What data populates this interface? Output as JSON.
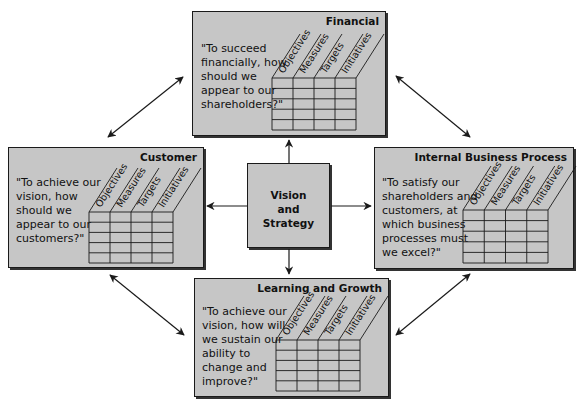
{
  "diagram": {
    "type": "balanced-scorecard",
    "center": {
      "lines": [
        "Vision",
        "and",
        "Strategy"
      ]
    },
    "column_headers": [
      "Objectives",
      "Measures",
      "Targets",
      "Initiatives"
    ],
    "table_rows": 5,
    "perspectives": [
      {
        "id": "financial",
        "title": "Financial",
        "quote_lines": [
          "\"To succeed",
          "financially, how",
          "should we",
          "appear to our",
          "shareholders?\""
        ]
      },
      {
        "id": "customer",
        "title": "Customer",
        "quote_lines": [
          "\"To achieve our",
          "vision, how",
          "should we",
          "appear to our",
          "customers?\""
        ]
      },
      {
        "id": "internal",
        "title": "Internal Business Process",
        "quote_lines": [
          "\"To satisfy our",
          "shareholders and",
          "customers, at",
          "which business",
          "processes must",
          "we excel?\""
        ]
      },
      {
        "id": "learning",
        "title": "Learning and Growth",
        "quote_lines": [
          "\"To achieve our",
          "vision, how will",
          "we sustain our",
          "ability to",
          "change and",
          "improve?\""
        ]
      }
    ],
    "connections": [
      "center->financial",
      "center->customer",
      "center->internal",
      "center->learning",
      "financial<->customer",
      "financial<->internal",
      "customer<->learning",
      "internal<->learning"
    ],
    "colors": {
      "box_fill": "#c6c6c6",
      "border": "#1a1a1a",
      "arrow": "#1a1a1a",
      "background": "#ffffff"
    }
  }
}
